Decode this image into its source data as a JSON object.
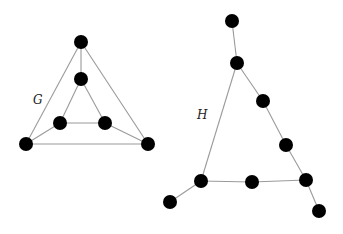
{
  "diagram": {
    "width": 343,
    "height": 234,
    "colors": {
      "node": "#000000",
      "edge": "#9a9a9a",
      "label": "#222222",
      "background": "#ffffff"
    },
    "node_radius": 7,
    "graphs": [
      {
        "id": "G",
        "label": "G",
        "label_pos": [
          33,
          104
        ],
        "nodes": [
          {
            "id": "g_top",
            "x": 81,
            "y": 42
          },
          {
            "id": "g_mid",
            "x": 81,
            "y": 79
          },
          {
            "id": "g_inner_left",
            "x": 60,
            "y": 123
          },
          {
            "id": "g_inner_right",
            "x": 105,
            "y": 123
          },
          {
            "id": "g_outer_left",
            "x": 26,
            "y": 144
          },
          {
            "id": "g_outer_right",
            "x": 148,
            "y": 144
          }
        ],
        "edges": [
          [
            "g_top",
            "g_mid"
          ],
          [
            "g_top",
            "g_outer_left"
          ],
          [
            "g_top",
            "g_outer_right"
          ],
          [
            "g_mid",
            "g_inner_left"
          ],
          [
            "g_mid",
            "g_inner_right"
          ],
          [
            "g_inner_left",
            "g_inner_right"
          ],
          [
            "g_inner_left",
            "g_outer_left"
          ],
          [
            "g_inner_right",
            "g_outer_right"
          ],
          [
            "g_outer_left",
            "g_outer_right"
          ]
        ]
      },
      {
        "id": "H",
        "label": "H",
        "label_pos": [
          197,
          119
        ],
        "nodes": [
          {
            "id": "h_top",
            "x": 232,
            "y": 21
          },
          {
            "id": "h_apex",
            "x": 237,
            "y": 63
          },
          {
            "id": "h_right1",
            "x": 263,
            "y": 101
          },
          {
            "id": "h_right2",
            "x": 286,
            "y": 145
          },
          {
            "id": "h_bottom_right",
            "x": 306,
            "y": 180
          },
          {
            "id": "h_bottom_left",
            "x": 201,
            "y": 181
          },
          {
            "id": "h_bottom_mid",
            "x": 252,
            "y": 182
          },
          {
            "id": "h_pendant_left",
            "x": 170,
            "y": 202
          },
          {
            "id": "h_pendant_right",
            "x": 319,
            "y": 211
          }
        ],
        "edges": [
          [
            "h_top",
            "h_apex"
          ],
          [
            "h_apex",
            "h_right1"
          ],
          [
            "h_right1",
            "h_right2"
          ],
          [
            "h_right2",
            "h_bottom_right"
          ],
          [
            "h_apex",
            "h_bottom_left"
          ],
          [
            "h_bottom_left",
            "h_bottom_mid"
          ],
          [
            "h_bottom_mid",
            "h_bottom_right"
          ],
          [
            "h_bottom_left",
            "h_pendant_left"
          ],
          [
            "h_bottom_right",
            "h_pendant_right"
          ]
        ]
      }
    ]
  }
}
